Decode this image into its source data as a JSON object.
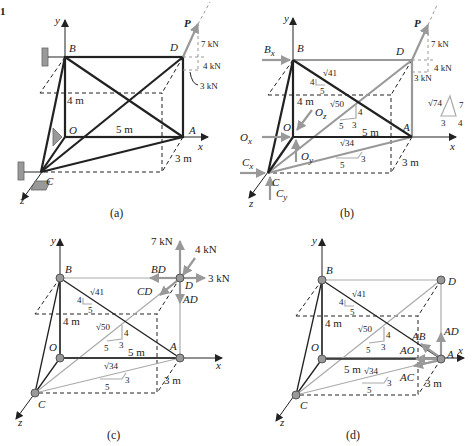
{
  "figure": {
    "fig_tag": "1",
    "panels": [
      {
        "caption": "(a)",
        "force_label": "P",
        "components": [
          "7 kN",
          "4 kN",
          "3 kN"
        ]
      },
      {
        "caption": "(b)",
        "reactions": [
          "Bx",
          "Ox",
          "Oz",
          "Oy",
          "Cx",
          "Cy"
        ],
        "force_label": "P",
        "components": [
          "7 kN",
          "4 kN",
          "3 kN"
        ],
        "slope_triangle": {
          "hyp": "√74",
          "a": "7",
          "b": "3",
          "c": "4"
        }
      },
      {
        "caption": "(c)",
        "forces": [
          "7 kN",
          "4 kN",
          "3 kN",
          "BD",
          "CD",
          "AD"
        ]
      },
      {
        "caption": "(d)",
        "forces": [
          "AD",
          "AB",
          "AO",
          "AC"
        ]
      }
    ],
    "nodes": {
      "B": "B",
      "D": "D",
      "O": "O",
      "A": "A",
      "C": "C"
    },
    "axes": {
      "x": "x",
      "y": "y",
      "z": "z"
    },
    "dims": {
      "height": "4 m",
      "length": "5 m",
      "depth": "3 m"
    },
    "slopes": {
      "BA": {
        "hyp": "√41",
        "rise": "4",
        "run": "5"
      },
      "CD": {
        "hyp": "√50",
        "rise": "4",
        "run": "5",
        "depth": "3"
      },
      "CA": {
        "hyp": "√34",
        "run": "5",
        "depth": "3"
      }
    },
    "sup": {
      "x": "x",
      "y": "y",
      "z": "z"
    }
  }
}
